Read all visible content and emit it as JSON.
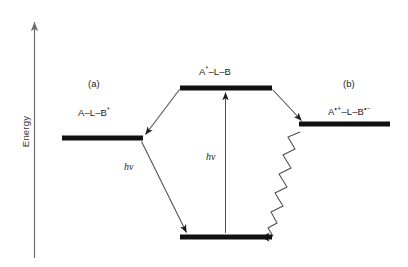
{
  "diagram": {
    "kind": "energy-level-diagram",
    "axis": {
      "label": "Energy",
      "orientation": "vertical",
      "arrow_direction": "up"
    },
    "panels": [
      {
        "id": "a",
        "tag": "(a)"
      },
      {
        "id": "b",
        "tag": "(b)"
      }
    ],
    "levels": [
      {
        "id": "locally-excited-acceptor",
        "label_plain": "A–L–B*",
        "label_parts": {
          "base": "A–L–B",
          "sup": "*"
        },
        "panel": "a"
      },
      {
        "id": "locally-excited-donor",
        "label_plain": "A*–L–B",
        "label_parts": {
          "pre": "A",
          "pre_sup": "*",
          "post": "–L–B"
        },
        "panel": "top"
      },
      {
        "id": "charge-separated-state",
        "label_plain": "A•+–L–B•−",
        "label_parts": {
          "pre": "A",
          "pre_sup": "•+",
          "mid": "–L–B",
          "post_sup": "•−"
        },
        "panel": "b"
      },
      {
        "id": "ground-state",
        "label_plain": "",
        "panel": "bottom"
      }
    ],
    "transitions": [
      {
        "id": "emission-left",
        "label": "hν",
        "type": "radiative",
        "from": "locally-excited-acceptor",
        "to": "ground-state"
      },
      {
        "id": "absorption-center",
        "label": "hν",
        "type": "radiative",
        "from": "ground-state",
        "to": "locally-excited-donor"
      },
      {
        "id": "energy-transfer-left",
        "label": "",
        "type": "radiative",
        "from": "locally-excited-donor",
        "to": "locally-excited-acceptor"
      },
      {
        "id": "electron-transfer-right",
        "label": "",
        "type": "radiative",
        "from": "locally-excited-donor",
        "to": "charge-separated-state"
      },
      {
        "id": "radiationless-decay",
        "label": "",
        "type": "nonradiative-zigzag",
        "from": "charge-separated-state",
        "to": "ground-state"
      }
    ],
    "colors": {
      "level_bar": "#111111",
      "arrow_line": "#4d4d4d",
      "axis": "#6b6b6b",
      "text": "#1b1b1b",
      "background": "#ffffff"
    }
  }
}
